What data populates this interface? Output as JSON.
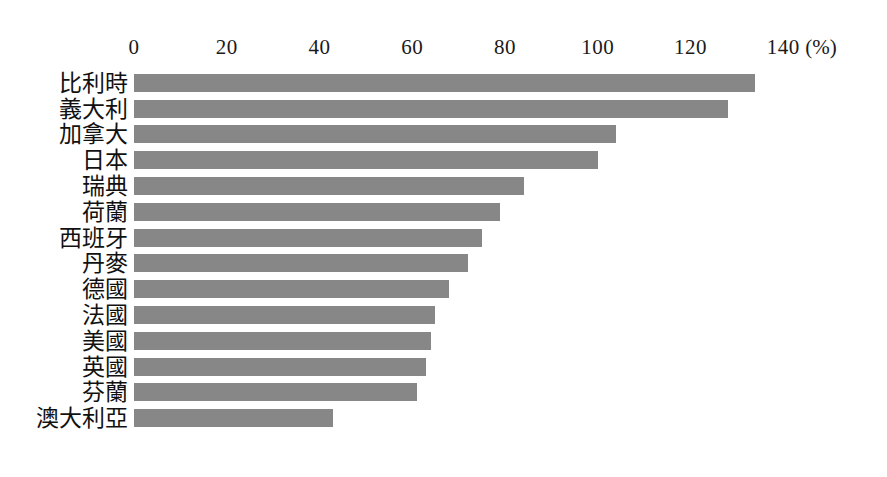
{
  "chart_data": {
    "type": "bar",
    "orientation": "horizontal",
    "title": "",
    "subtitle": "",
    "xlabel": "",
    "ylabel": "",
    "unit_label": "(%)",
    "xlim": [
      0,
      140
    ],
    "x_ticks": [
      0,
      20,
      40,
      60,
      80,
      100,
      120,
      140
    ],
    "x_tick_labels": [
      "0",
      "20",
      "40",
      "60",
      "80",
      "100",
      "120",
      "140"
    ],
    "grid": false,
    "legend": false,
    "legend_position": "none",
    "bar_color": "#878787",
    "background_color": "#ffffff",
    "categories": [
      "比利時",
      "義大利",
      "加拿大",
      "日本",
      "瑞典",
      "荷蘭",
      "西班牙",
      "丹麥",
      "德國",
      "法國",
      "美國",
      "英國",
      "芬蘭",
      "澳大利亞"
    ],
    "values": [
      134,
      128,
      104,
      100,
      84,
      79,
      75,
      72,
      68,
      65,
      64,
      63,
      61,
      43
    ],
    "bars": [
      {
        "label": "比利時",
        "value": 134
      },
      {
        "label": "義大利",
        "value": 128
      },
      {
        "label": "加拿大",
        "value": 104
      },
      {
        "label": "日本",
        "value": 100
      },
      {
        "label": "瑞典",
        "value": 84
      },
      {
        "label": "荷蘭",
        "value": 79
      },
      {
        "label": "西班牙",
        "value": 75
      },
      {
        "label": "丹麥",
        "value": 72
      },
      {
        "label": "德國",
        "value": 68
      },
      {
        "label": "法國",
        "value": 65
      },
      {
        "label": "美國",
        "value": 64
      },
      {
        "label": "英國",
        "value": 63
      },
      {
        "label": "芬蘭",
        "value": 61
      },
      {
        "label": "澳大利亞",
        "value": 43
      }
    ]
  }
}
